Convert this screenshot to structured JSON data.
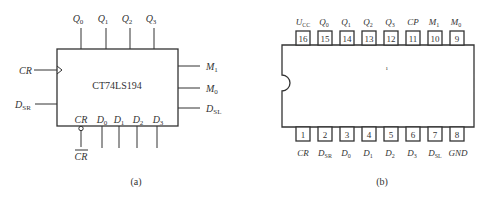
{
  "figure_a": {
    "caption": "(a)",
    "chip_label": "CT74LS194",
    "top_pins": [
      {
        "main": "Q",
        "sub": "0"
      },
      {
        "main": "Q",
        "sub": "1"
      },
      {
        "main": "Q",
        "sub": "2"
      },
      {
        "main": "Q",
        "sub": "3"
      }
    ],
    "left_pins": [
      {
        "main": "CR",
        "sub": "",
        "clock": true
      },
      {
        "main": "D",
        "sub": "SR"
      }
    ],
    "right_pins": [
      {
        "main": "M",
        "sub": "1"
      },
      {
        "main": "M",
        "sub": "0"
      },
      {
        "main": "D",
        "sub": "SL"
      }
    ],
    "bottom_inside_labels": [
      {
        "main": "CR",
        "sub": ""
      },
      {
        "main": "D",
        "sub": "0"
      },
      {
        "main": "D",
        "sub": "1"
      },
      {
        "main": "D",
        "sub": "2"
      },
      {
        "main": "D",
        "sub": "3"
      }
    ],
    "bottom_outside_label": "CR"
  },
  "figure_b": {
    "caption": "(b)",
    "top_pins": [
      {
        "num": "16",
        "main": "U",
        "sub": "CC"
      },
      {
        "num": "15",
        "main": "Q",
        "sub": "0"
      },
      {
        "num": "14",
        "main": "Q",
        "sub": "1"
      },
      {
        "num": "13",
        "main": "Q",
        "sub": "2"
      },
      {
        "num": "12",
        "main": "Q",
        "sub": "3"
      },
      {
        "num": "11",
        "main": "CP",
        "sub": ""
      },
      {
        "num": "10",
        "main": "M",
        "sub": "1"
      },
      {
        "num": "9",
        "main": "M",
        "sub": "0"
      }
    ],
    "bottom_pins": [
      {
        "num": "1",
        "main": "CR",
        "sub": ""
      },
      {
        "num": "2",
        "main": "D",
        "sub": "SR"
      },
      {
        "num": "3",
        "main": "D",
        "sub": "0"
      },
      {
        "num": "4",
        "main": "D",
        "sub": "1"
      },
      {
        "num": "5",
        "main": "D",
        "sub": "2"
      },
      {
        "num": "6",
        "main": "D",
        "sub": "3"
      },
      {
        "num": "7",
        "main": "D",
        "sub": "SL"
      },
      {
        "num": "8",
        "main": "GND",
        "sub": ""
      }
    ]
  }
}
